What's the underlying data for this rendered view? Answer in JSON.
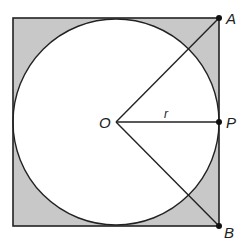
{
  "diagram": {
    "type": "geometry",
    "colors": {
      "background": "#ffffff",
      "shade": "#c8c8c8",
      "stroke": "#222222"
    },
    "square": {
      "x": 13,
      "y": 18,
      "size": 206
    },
    "circle": {
      "cx": 116,
      "cy": 122,
      "r": 103
    },
    "points": {
      "O": {
        "label": "O",
        "x": 116,
        "y": 122
      },
      "A": {
        "label": "A",
        "x": 219,
        "y": 18
      },
      "P": {
        "label": "P",
        "x": 219,
        "y": 122
      },
      "B": {
        "label": "B",
        "x": 219,
        "y": 226
      }
    },
    "segments": [
      {
        "from": "O",
        "to": "A"
      },
      {
        "from": "O",
        "to": "P",
        "label": "r"
      },
      {
        "from": "O",
        "to": "B"
      }
    ],
    "labels": {
      "O": "O",
      "A": "A",
      "P": "P",
      "B": "B",
      "r": "r"
    }
  }
}
